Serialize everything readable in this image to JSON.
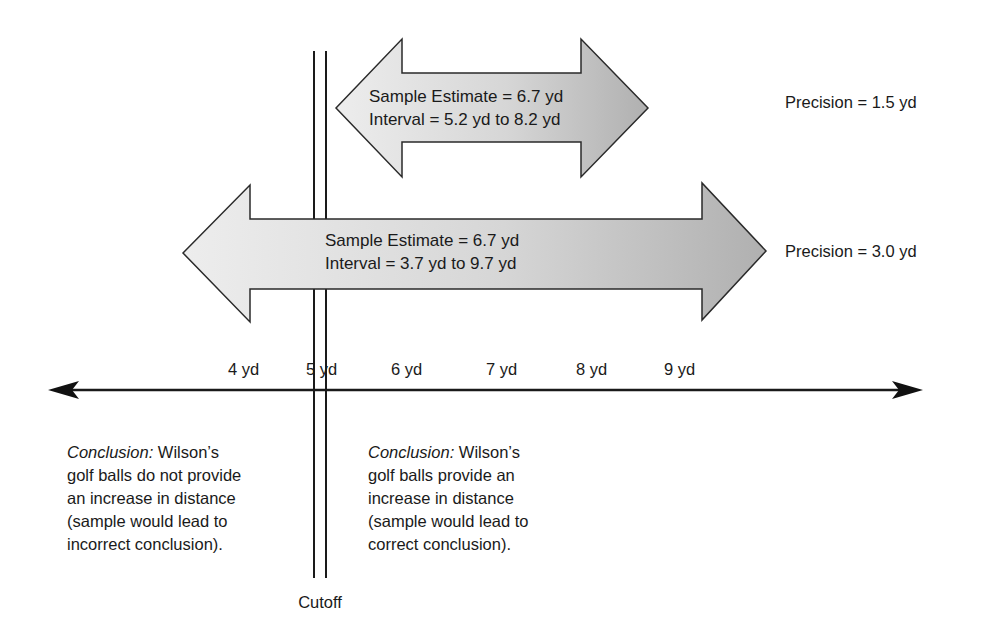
{
  "figure": {
    "top_arrow": {
      "line1": "Sample Estimate = 6.7 yd",
      "line2": "Interval = 5.2 yd to 8.2 yd",
      "precision": "Precision = 1.5 yd",
      "interval_low": 5.2,
      "interval_high": 8.2
    },
    "bottom_arrow": {
      "line1": "Sample Estimate = 6.7 yd",
      "line2": "Interval = 3.7 yd to 9.7 yd",
      "precision": "Precision = 3.0 yd",
      "interval_low": 3.7,
      "interval_high": 9.7
    },
    "axis": {
      "ticks": [
        "4 yd",
        "5 yd",
        "6 yd",
        "7 yd",
        "8 yd",
        "9 yd"
      ]
    },
    "cutoff": {
      "label": "Cutoff",
      "value": 5
    },
    "left_conclusion": {
      "prefix": "Conclusion:",
      "line1_rest": " Wilson’s",
      "line2": "golf balls do not provide",
      "line3": "an increase in distance",
      "line4": "(sample would lead to",
      "line5": "incorrect conclusion)."
    },
    "right_conclusion": {
      "prefix": "Conclusion:",
      "line1_rest": " Wilson’s",
      "line2": "golf balls provide an",
      "line3": "increase in distance",
      "line4": "(sample would lead to",
      "line5": "correct conclusion)."
    },
    "colors": {
      "arrow_fill_light": "#ececec",
      "arrow_fill_dark": "#b3b3b3",
      "stroke": "#222222"
    }
  }
}
